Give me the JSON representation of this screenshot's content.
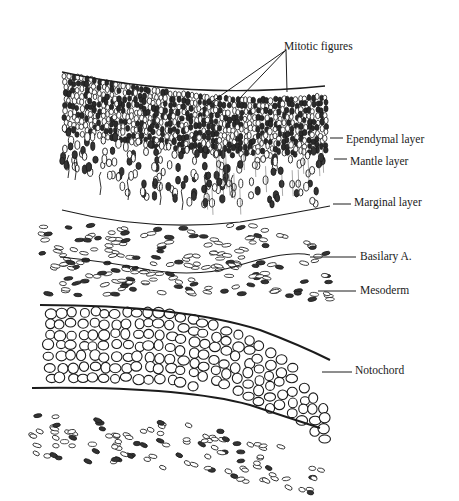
{
  "figure": {
    "labels": [
      {
        "id": "mitotic",
        "text": "Mitotic figures",
        "x": 284,
        "y": 46
      },
      {
        "id": "ependymal",
        "text": "Ependymal layer",
        "x": 346,
        "y": 138
      },
      {
        "id": "mantle",
        "text": "Mantle layer",
        "x": 350,
        "y": 159
      },
      {
        "id": "marginal",
        "text": "Marginal layer",
        "x": 354,
        "y": 201
      },
      {
        "id": "basilary",
        "text": "Basilary A.",
        "x": 360,
        "y": 254
      },
      {
        "id": "mesoderm",
        "text": "Mesoderm",
        "x": 360,
        "y": 288
      },
      {
        "id": "notochord",
        "text": "Notochord",
        "x": 355,
        "y": 368
      }
    ]
  }
}
